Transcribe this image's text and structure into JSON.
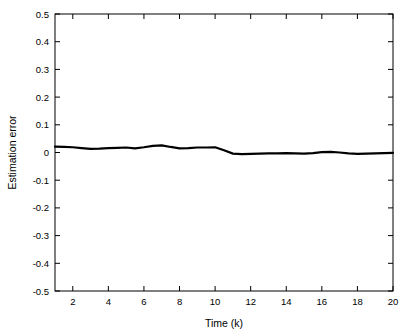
{
  "chart_data": {
    "type": "line",
    "title": "",
    "xlabel": "Time (k)",
    "ylabel": "Estimation error",
    "xlim": [
      1,
      20
    ],
    "ylim": [
      -0.5,
      0.5
    ],
    "grid": false,
    "legend": null,
    "xticks": [
      2,
      4,
      6,
      8,
      10,
      12,
      14,
      16,
      18,
      20
    ],
    "xtick_labels": [
      "2",
      "4",
      "6",
      "8",
      "10",
      "12",
      "14",
      "16",
      "18",
      "20"
    ],
    "yticks": [
      -0.5,
      -0.4,
      -0.3,
      -0.2,
      -0.1,
      0,
      0.1,
      0.2,
      0.3,
      0.4,
      0.5
    ],
    "ytick_labels": [
      "-0.5",
      "-0.4",
      "-0.3",
      "-0.2",
      "-0.1",
      "0",
      "0.1",
      "0.2",
      "0.3",
      "0.4",
      "0.5"
    ],
    "series": [
      {
        "name": "Estimation error",
        "color": "#000000",
        "line_width": 2.2,
        "x": [
          1,
          1.5,
          2,
          2.5,
          3,
          3.5,
          4,
          4.5,
          5,
          5.5,
          6,
          6.5,
          7,
          7.5,
          8,
          8.5,
          9,
          9.5,
          10,
          10.5,
          11,
          11.5,
          12,
          12.5,
          13,
          13.5,
          14,
          14.5,
          15,
          15.5,
          16,
          16.5,
          17,
          17.5,
          18,
          18.5,
          19,
          19.5,
          20
        ],
        "y": [
          0.021,
          0.02,
          0.019,
          0.016,
          0.013,
          0.014,
          0.016,
          0.017,
          0.018,
          0.015,
          0.019,
          0.024,
          0.026,
          0.02,
          0.015,
          0.016,
          0.018,
          0.018,
          0.019,
          0.008,
          -0.004,
          -0.006,
          -0.005,
          -0.004,
          -0.003,
          -0.003,
          -0.002,
          -0.003,
          -0.004,
          -0.002,
          0.001,
          0.002,
          0.0,
          -0.003,
          -0.005,
          -0.004,
          -0.003,
          -0.002,
          -0.001
        ]
      }
    ]
  }
}
